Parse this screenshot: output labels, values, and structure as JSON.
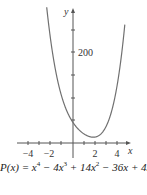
{
  "chart_data": {
    "type": "line",
    "title": "",
    "function": "P(x) = x^4 - 4x^3 + 14x^2 - 36x + 45",
    "xlabel": "x",
    "ylabel": "y",
    "x_ticks": [
      -4,
      -2,
      2,
      4
    ],
    "x_tick_labels": [
      "−4",
      "−2",
      "2",
      "4"
    ],
    "y_tick_labels": [
      "200"
    ],
    "y_tick_step": 50,
    "xlim": [
      -5,
      5
    ],
    "ylim": [
      0,
      300
    ],
    "grid": false,
    "x": [
      -2.4,
      -2,
      -1.5,
      -1,
      -0.5,
      0,
      0.5,
      1,
      1.5,
      2,
      2.5,
      3,
      3.5,
      4,
      4.5,
      4.7
    ],
    "values": [
      300.6,
      225,
      154.6,
      100,
      67.6,
      45,
      28.6,
      20,
      15.6,
      13,
      15.6,
      18,
      36.6,
      77,
      148.6,
      185.8
    ],
    "colors": {
      "curve": "#707070",
      "axis": "#555555"
    }
  },
  "labels": {
    "y_axis": "y",
    "x_axis": "x",
    "y200": "200",
    "xm4": "−4",
    "xm2": "−2",
    "x2": "2",
    "x4": "4"
  },
  "caption": {
    "lhs": "P(x) = x",
    "e1": "4",
    "t2": " − 4x",
    "e2": "3",
    "t3": " + 14x",
    "e3": "2",
    "t4": " − 36x + 45"
  }
}
